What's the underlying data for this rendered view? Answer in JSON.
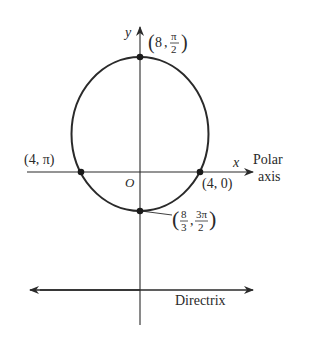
{
  "diagram": {
    "type": "polar-conic-ellipse",
    "axes": {
      "x_label": "x",
      "y_label": "y",
      "origin_label": "O",
      "polar_axis_label_line1": "Polar",
      "polar_axis_label_line2": "axis"
    },
    "directrix_label": "Directrix",
    "points": [
      {
        "id": "top",
        "label_r": "8",
        "label_theta_num": "π",
        "label_theta_den": "2"
      },
      {
        "id": "left",
        "label": "(4, π)"
      },
      {
        "id": "right",
        "label": "(4, 0)"
      },
      {
        "id": "bottom",
        "label_r_num": "8",
        "label_r_den": "3",
        "label_theta_num": "3π",
        "label_theta_den": "2"
      }
    ],
    "colors": {
      "stroke": "#2a2a2a",
      "background": "#ffffff"
    }
  }
}
